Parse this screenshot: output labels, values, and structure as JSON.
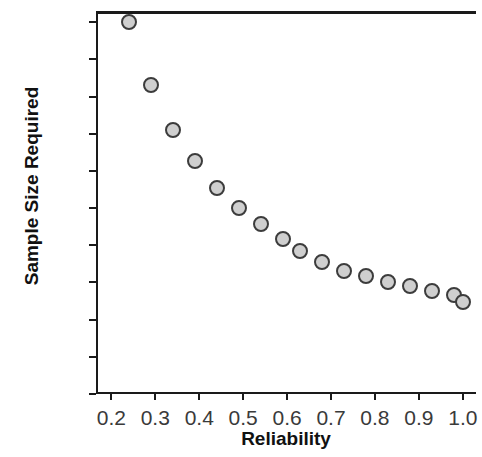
{
  "chart_data": {
    "type": "scatter",
    "title": "",
    "xlabel": "Reliability",
    "ylabel": "Sample Size Required",
    "xlim": [
      0.165,
      1.03
    ],
    "ylim": [
      0,
      515
    ],
    "grid": false,
    "legend": null,
    "xticks": [
      "0.2",
      "0.3",
      "0.4",
      "0.5",
      "0.6",
      "0.7",
      "0.8",
      "0.9",
      "1.0"
    ],
    "xtick_values": [
      0.2,
      0.3,
      0.4,
      0.5,
      0.6,
      0.7,
      0.8,
      0.9,
      1.0
    ],
    "yticks": [
      "0",
      "50",
      "100",
      "150",
      "200",
      "250",
      "300",
      "350",
      "400",
      "450",
      "500"
    ],
    "ytick_values": [
      0,
      50,
      100,
      150,
      200,
      250,
      300,
      350,
      400,
      450,
      500
    ],
    "marker": {
      "shape": "circle",
      "fill_color": "#cfcfcf",
      "edge_color": "#3c3c3c",
      "size_px": 16
    },
    "x": [
      0.24,
      0.29,
      0.34,
      0.39,
      0.44,
      0.49,
      0.54,
      0.59,
      0.63,
      0.68,
      0.73,
      0.78,
      0.83,
      0.88,
      0.93,
      0.98,
      1.0
    ],
    "y": [
      500,
      416,
      355,
      313,
      277,
      250,
      229,
      208,
      192,
      178,
      166,
      158,
      150,
      145,
      139,
      133,
      124
    ],
    "points": [
      {
        "x": 0.24,
        "y": 500
      },
      {
        "x": 0.29,
        "y": 416
      },
      {
        "x": 0.34,
        "y": 355
      },
      {
        "x": 0.39,
        "y": 313
      },
      {
        "x": 0.44,
        "y": 277
      },
      {
        "x": 0.49,
        "y": 250
      },
      {
        "x": 0.54,
        "y": 229
      },
      {
        "x": 0.59,
        "y": 208
      },
      {
        "x": 0.63,
        "y": 192
      },
      {
        "x": 0.68,
        "y": 178
      },
      {
        "x": 0.73,
        "y": 166
      },
      {
        "x": 0.78,
        "y": 158
      },
      {
        "x": 0.83,
        "y": 150
      },
      {
        "x": 0.88,
        "y": 145
      },
      {
        "x": 0.93,
        "y": 139
      },
      {
        "x": 0.98,
        "y": 133
      },
      {
        "x": 1.0,
        "y": 124
      }
    ]
  }
}
